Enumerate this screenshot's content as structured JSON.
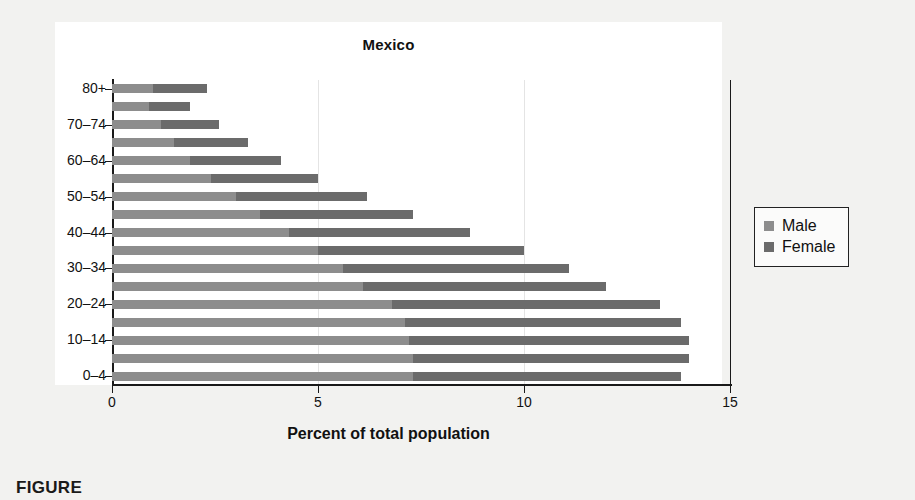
{
  "chart_data": {
    "type": "bar",
    "orientation": "horizontal",
    "stacked": true,
    "title": "Mexico",
    "xlabel": "Percent of total population",
    "ylabel": "",
    "xlim": [
      0,
      15
    ],
    "xticks": [
      0,
      5,
      10,
      15
    ],
    "xtick_labels": [
      "0",
      "5",
      "10",
      "15"
    ],
    "grid": "vertical-light",
    "legend_position": "right",
    "categories": [
      "0–4",
      "5–9",
      "10–14",
      "15–19",
      "20–24",
      "25–29",
      "30–34",
      "35–39",
      "40–44",
      "45–49",
      "50–54",
      "55–59",
      "60–64",
      "65–69",
      "70–74",
      "75–79",
      "80+"
    ],
    "visible_tick_labels": [
      "0–4",
      "10–14",
      "20–24",
      "30–34",
      "40–44",
      "50–54",
      "60–64",
      "70–74",
      "80+"
    ],
    "series": [
      {
        "name": "Male",
        "color": "#8d8d8d",
        "values": [
          7.3,
          7.3,
          7.2,
          7.1,
          6.8,
          6.1,
          5.6,
          5.0,
          4.3,
          3.6,
          3.0,
          2.4,
          1.9,
          1.5,
          1.2,
          0.9,
          1.0
        ]
      },
      {
        "name": "Female",
        "color": "#6b6b6b",
        "values": [
          6.5,
          6.7,
          6.8,
          6.7,
          6.5,
          5.9,
          5.5,
          5.0,
          4.4,
          3.7,
          3.2,
          2.6,
          2.2,
          1.8,
          1.4,
          1.0,
          1.3
        ]
      }
    ],
    "totals": [
      13.8,
      14.0,
      14.0,
      13.8,
      13.3,
      12.0,
      11.1,
      10.0,
      8.7,
      7.3,
      6.2,
      5.0,
      4.1,
      3.3,
      2.6,
      1.9,
      2.3
    ]
  },
  "legend": {
    "entries": [
      {
        "label": "Male",
        "color": "#8d8d8d"
      },
      {
        "label": "Female",
        "color": "#6b6b6b"
      }
    ]
  },
  "caption": {
    "text": "FIGURE"
  }
}
